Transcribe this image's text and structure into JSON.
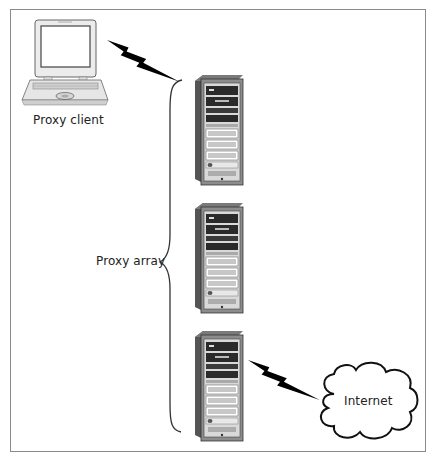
{
  "diagram": {
    "type": "network-topology",
    "labels": {
      "client": "Proxy client",
      "array": "Proxy array",
      "internet": "Internet"
    },
    "nodes": [
      {
        "id": "proxy-client",
        "kind": "laptop",
        "label": "Proxy client"
      },
      {
        "id": "proxy-server-1",
        "kind": "server-tower",
        "group": "Proxy array"
      },
      {
        "id": "proxy-server-2",
        "kind": "server-tower",
        "group": "Proxy array"
      },
      {
        "id": "proxy-server-3",
        "kind": "server-tower",
        "group": "Proxy array"
      },
      {
        "id": "internet",
        "kind": "cloud",
        "label": "Internet"
      }
    ],
    "connections": [
      {
        "from": "proxy-client",
        "to": "Proxy array",
        "style": "lightning-bolt"
      },
      {
        "from": "proxy-server-3",
        "to": "internet",
        "style": "lightning-bolt"
      }
    ],
    "groups": [
      {
        "label": "Proxy array",
        "members": [
          "proxy-server-1",
          "proxy-server-2",
          "proxy-server-3"
        ],
        "style": "curly-brace"
      }
    ],
    "colors": {
      "border": "#8a8a8a",
      "server_dark": "#4a4a4a",
      "server_mid": "#7a7a7a",
      "server_light": "#d6d6d6",
      "bolt": "#000000",
      "text": "#222222"
    }
  }
}
